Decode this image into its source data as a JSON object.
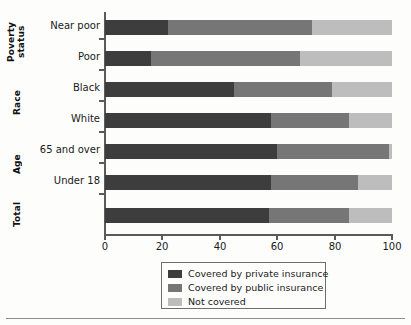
{
  "chart_data": {
    "type": "bar",
    "orientation": "horizontal",
    "stacked": true,
    "title": "",
    "xlabel": "",
    "ylabel": "",
    "xlim": [
      0,
      100
    ],
    "xticks": [
      0,
      20,
      40,
      60,
      80,
      100
    ],
    "xticklabels": [
      "0",
      "20",
      "40",
      "60",
      "80",
      "100"
    ],
    "grid": false,
    "legend_position": "bottom-center",
    "categories": [
      "Near poor",
      "Poor",
      "Black",
      "White",
      "65 and over",
      "Under 18",
      "Total"
    ],
    "group_labels": [
      "Poverty status",
      "Race",
      "Age",
      "Total"
    ],
    "groups": [
      {
        "name": "Poverty\nstatus",
        "categories": [
          "Near poor",
          "Poor"
        ]
      },
      {
        "name": "Race",
        "categories": [
          "Black",
          "White"
        ]
      },
      {
        "name": "Age",
        "categories": [
          "65 and over",
          "Under 18"
        ]
      },
      {
        "name": "Total",
        "categories": [
          ""
        ]
      }
    ],
    "series": [
      {
        "name": "Covered by private insurance",
        "color": "#3d3d3d",
        "values": [
          22,
          16,
          45,
          58,
          60,
          58,
          57
        ]
      },
      {
        "name": "Covered by public insurance",
        "color": "#767676",
        "values": [
          50,
          52,
          34,
          27,
          39,
          30,
          28
        ]
      },
      {
        "name": "Not covered",
        "color": "#bdbdbd",
        "values": [
          28,
          32,
          21,
          15,
          1,
          12,
          15
        ]
      }
    ],
    "bars": [
      {
        "label": "Near poor",
        "group": "Poverty status",
        "private": 22,
        "public": 50,
        "not_covered": 28
      },
      {
        "label": "Poor",
        "group": "Poverty status",
        "private": 16,
        "public": 52,
        "not_covered": 32
      },
      {
        "label": "Black",
        "group": "Race",
        "private": 45,
        "public": 34,
        "not_covered": 21
      },
      {
        "label": "White",
        "group": "Race",
        "private": 58,
        "public": 27,
        "not_covered": 15
      },
      {
        "label": "65 and over",
        "group": "Age",
        "private": 60,
        "public": 39,
        "not_covered": 1
      },
      {
        "label": "Under 18",
        "group": "Age",
        "private": 58,
        "public": 30,
        "not_covered": 12
      },
      {
        "label": "",
        "group": "Total",
        "private": 57,
        "public": 28,
        "not_covered": 15
      }
    ],
    "legend": [
      {
        "label": "Covered by private insurance",
        "color": "#3d3d3d"
      },
      {
        "label": "Covered by public insurance",
        "color": "#767676"
      },
      {
        "label": "Not covered",
        "color": "#bdbdbd"
      }
    ]
  },
  "axis": {
    "x_ticklabels": {
      "t0": "0",
      "t1": "20",
      "t2": "40",
      "t3": "60",
      "t4": "80",
      "t5": "100"
    }
  },
  "row_labels": {
    "r0": "Near poor",
    "r1": "Poor",
    "r2": "Black",
    "r3": "White",
    "r4": "65 and over",
    "r5": "Under 18",
    "r6": ""
  },
  "group_labels": {
    "g0": "Poverty\nstatus",
    "g1": "Race",
    "g2": "Age",
    "g3": "Total"
  },
  "legend_labels": {
    "l0": "Covered by private insurance",
    "l1": "Covered by public insurance",
    "l2": "Not covered"
  }
}
